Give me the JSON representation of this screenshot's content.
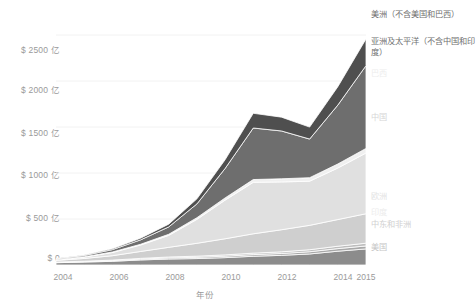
{
  "chart_data": {
    "type": "area",
    "stacked": true,
    "title": "",
    "xlabel": "年份",
    "ylabel": "",
    "grid": true,
    "legend_position": "right",
    "x": [
      2004,
      2005,
      2006,
      2007,
      2008,
      2009,
      2010,
      2011,
      2012,
      2013,
      2014,
      2015
    ],
    "categories": [
      "2004",
      "2005",
      "2006",
      "2007",
      "2008",
      "2009",
      "2010",
      "2011",
      "2012",
      "2013",
      "2014",
      "2015"
    ],
    "xticks": [
      "2004",
      "2006",
      "2008",
      "2010",
      "2012",
      "2014",
      "2015"
    ],
    "yticks": [
      "$ 0",
      "$ 500 亿",
      "$ 1000 亿",
      "$ 1500 亿",
      "$ 2000 亿",
      "$ 2500 亿"
    ],
    "ytick_values": [
      0,
      500,
      1000,
      1500,
      2000,
      2500
    ],
    "ylim": [
      0,
      2750
    ],
    "xlim": [
      2004,
      2015
    ],
    "unit_note": "亿美元",
    "series": [
      {
        "name": "美国",
        "color": "#8c8c8c",
        "values": [
          25,
          32,
          40,
          55,
          65,
          70,
          80,
          95,
          105,
          120,
          150,
          175
        ]
      },
      {
        "name": "中东和非洲",
        "color": "#a8a8a8",
        "values": [
          4,
          5,
          7,
          9,
          12,
          14,
          16,
          18,
          20,
          24,
          28,
          32
        ]
      },
      {
        "name": "印度",
        "color": "#bdbdbd",
        "values": [
          3,
          4,
          6,
          8,
          10,
          12,
          14,
          16,
          18,
          22,
          26,
          30
        ]
      },
      {
        "name": "欧洲",
        "color": "#cfcfcf",
        "values": [
          18,
          30,
          48,
          75,
          105,
          140,
          175,
          210,
          240,
          265,
          290,
          320
        ]
      },
      {
        "name": "中国",
        "color": "#e0e0e0",
        "values": [
          6,
          15,
          35,
          70,
          130,
          260,
          420,
          560,
          520,
          480,
          560,
          660
        ]
      },
      {
        "name": "巴西",
        "color": "#f0f0f0",
        "values": [
          2,
          3,
          5,
          8,
          12,
          18,
          24,
          30,
          34,
          38,
          44,
          50
        ]
      },
      {
        "name": "亚洲及太平洋（不含中国和印度）",
        "color": "#6e6e6e",
        "values": [
          8,
          14,
          26,
          48,
          80,
          150,
          320,
          560,
          520,
          420,
          640,
          900
        ]
      },
      {
        "name": "美洲（不含美国和巴西）",
        "color": "#4f4f4f",
        "values": [
          4,
          6,
          10,
          18,
          30,
          55,
          95,
          160,
          150,
          130,
          200,
          290
        ]
      }
    ],
    "totals": [
      70,
      109,
      177,
      291,
      444,
      719,
      1144,
      1649,
      1607,
      1499,
      1938,
      2457
    ],
    "legend": [
      {
        "label": "美洲（不含美国和巴西）",
        "color": "#4f4f4f",
        "text_color": "#6f6f6f"
      },
      {
        "label": "亚洲及太平洋（不含中国和印度）",
        "color": "#6e6e6e",
        "text_color": "#6f6f6f"
      },
      {
        "label": "巴西",
        "color": "#f0f0f0",
        "text_color": "#ededed"
      },
      {
        "label": "中国",
        "color": "#e0e0e0",
        "text_color": "#d6d6d6"
      },
      {
        "label": "欧洲",
        "color": "#cfcfcf",
        "text_color": "#e3e3e3"
      },
      {
        "label": "印度",
        "color": "#bdbdbd",
        "text_color": "#ececec"
      },
      {
        "label": "中东和非洲",
        "color": "#a8a8a8",
        "text_color": "#d0d0d0"
      },
      {
        "label": "美国",
        "color": "#8c8c8c",
        "text_color": "#c6c6c6"
      }
    ]
  },
  "axis": {
    "x_title": "年份",
    "yticks": [
      {
        "label": "$ 2500 亿"
      },
      {
        "label": "$ 2000 亿"
      },
      {
        "label": "$ 1500 亿"
      },
      {
        "label": "$ 1000 亿"
      },
      {
        "label": "$ 500 亿"
      },
      {
        "label": "$ 0"
      }
    ],
    "xticks": [
      {
        "label": "2004"
      },
      {
        "label": "2006"
      },
      {
        "label": "2008"
      },
      {
        "label": "2010"
      },
      {
        "label": "2012"
      },
      {
        "label": "2014"
      },
      {
        "label": "2015"
      }
    ]
  },
  "colors": {
    "background": "#ffffff",
    "tick_text": "#9a9a9a",
    "gridline": "#f2f2f2"
  }
}
